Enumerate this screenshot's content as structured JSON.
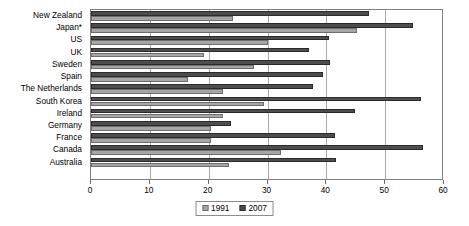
{
  "chart_data": {
    "type": "bar",
    "orientation": "horizontal",
    "title": "",
    "xlabel": "",
    "ylabel": "",
    "xlim": [
      0,
      60
    ],
    "xticks": [
      0,
      10,
      20,
      30,
      40,
      50,
      60
    ],
    "xtick_labels": [
      "0",
      "10",
      "20",
      "30",
      "40",
      "50",
      "60"
    ],
    "grid": true,
    "grid_axis": "x",
    "legend_position": "bottom-center",
    "categories": [
      "New Zealand",
      "Japan*",
      "US",
      "UK",
      "Sweden",
      "Spain",
      "The Netherlands",
      "South Korea",
      "Ireland",
      "Germany",
      "France",
      "Canada",
      "Australia"
    ],
    "series": [
      {
        "name": "1991",
        "color": "#a6a6a6",
        "values": [
          24.1,
          45.2,
          30.0,
          19.2,
          27.7,
          16.5,
          22.4,
          29.4,
          22.4,
          20.4,
          20.4,
          32.3,
          23.5
        ]
      },
      {
        "name": "2007",
        "color": "#4d4d4d",
        "values": [
          47.3,
          54.8,
          40.5,
          37.0,
          40.6,
          39.4,
          37.8,
          56.1,
          44.9,
          23.8,
          41.5,
          56.4,
          41.7
        ]
      }
    ]
  },
  "legend": {
    "entries": [
      {
        "label": "1991"
      },
      {
        "label": "2007"
      }
    ]
  }
}
